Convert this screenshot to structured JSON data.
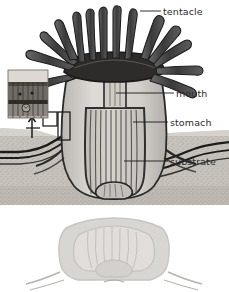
{
  "figure": {
    "background_color": "#ffffff",
    "label_color": "#2b2b2b",
    "leader_line_color": "#1a1a1a",
    "labels": [
      {
        "id": "tentacle",
        "text": "tentacle",
        "leader_from": [
          140,
          11
        ],
        "leader_to": [
          161,
          11
        ]
      },
      {
        "id": "mouth",
        "text": "mouth",
        "leader_from": [
          115,
          93
        ],
        "leader_to": [
          174,
          93
        ]
      },
      {
        "id": "stomach",
        "text": "stomach",
        "leader_from": [
          133,
          122
        ],
        "leader_to": [
          168,
          122
        ]
      },
      {
        "id": "substrate",
        "text": "substrate",
        "leader_from": [
          124,
          161
        ],
        "leader_to": [
          168,
          161
        ]
      }
    ],
    "parts": {
      "tentacle_crown": {
        "name": "tentacle-crown",
        "color": "#4a4a4a",
        "count": 14
      },
      "oral_disc": {
        "name": "oral-disc",
        "color": "#2a2a2a"
      },
      "mouth": {
        "name": "mouth-opening",
        "color": "#3a3a3a"
      },
      "pharynx": {
        "name": "pharynx",
        "color": "#cfcbc6"
      },
      "stomach": {
        "name": "stomach-cavity",
        "color": "#c9c5c0",
        "mesentery_count": 11
      },
      "column_wall": {
        "name": "body-column-wall",
        "color": "#d6d2cd"
      },
      "pedal_disc": {
        "name": "pedal-disc",
        "color": "#bdb9b4"
      },
      "substrate": {
        "name": "substrate-sediment",
        "color": "#c6c2bb",
        "texture": "stippled"
      },
      "substrate_bands": {
        "name": "substrate-layer-bands",
        "color": "#1c1c1c",
        "band_count": 3
      },
      "inset": {
        "name": "tissue-detail-inset",
        "color": "#8f8a84",
        "layers": 3
      },
      "callout_box": {
        "name": "magnification-callout-box",
        "color": "#111111"
      },
      "callout_arrow": {
        "name": "magnification-arrow",
        "color": "#111111"
      },
      "ghost_body": {
        "name": "faded-body-duplicate",
        "color": "#b4b0ab",
        "opacity": 0.55
      }
    }
  }
}
